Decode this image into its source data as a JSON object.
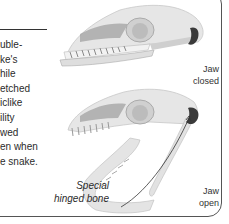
{
  "body_text_lines": [
    "uble-",
    "ke's",
    "hile",
    "etched",
    "iclike",
    "ility",
    "wed",
    "en when",
    "e snake."
  ],
  "labels": {
    "jaw_closed": [
      "Jaw",
      "closed"
    ],
    "jaw_open": [
      "Jaw",
      "open"
    ],
    "callout": [
      "Special",
      "hinged bone"
    ]
  },
  "colors": {
    "bone": "#e4e4e4",
    "bone_shade": "#b8b8b8",
    "highlight_bone": "#3a3a3a",
    "border": "#555555"
  }
}
